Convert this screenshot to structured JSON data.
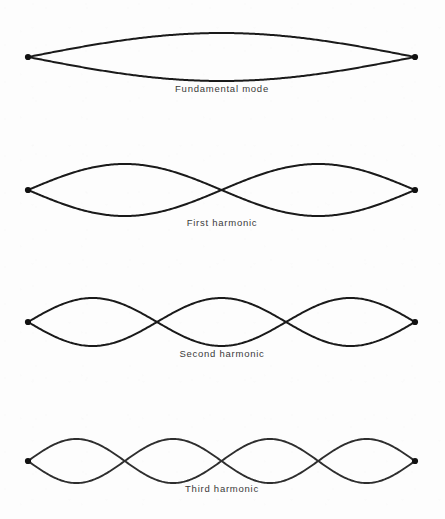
{
  "figure": {
    "background_color": "#fdfdfd",
    "line_color": "#1a1a1a",
    "label_color": "#3a3a3a",
    "string_left_x": 28,
    "string_right_x": 415
  },
  "modes": [
    {
      "label": "Fundamental mode",
      "loops": 1,
      "center_y": 57,
      "amplitude": 24,
      "label_y": 92,
      "label_x": 222,
      "style": "solid"
    },
    {
      "label": "First harmonic",
      "loops": 2,
      "center_y": 190,
      "amplitude": 26,
      "label_y": 226,
      "label_x": 222,
      "style": "solid"
    },
    {
      "label": "Second harmonic",
      "loops": 3,
      "center_y": 322,
      "amplitude": 24,
      "label_y": 357,
      "label_x": 222,
      "style": "solid"
    },
    {
      "label": "Third harmonic",
      "loops": 4,
      "center_y": 461,
      "amplitude": 22,
      "label_y": 492,
      "label_x": 222,
      "style": "faded"
    }
  ],
  "chart_data": {
    "type": "line",
    "xlabel": "",
    "ylabel": "",
    "x_range": [
      28,
      415
    ],
    "series": [
      {
        "name": "Fundamental mode",
        "harmonic_number": 1,
        "loops": 1,
        "nodes": 2,
        "antinodes": 1,
        "amplitude": 24,
        "baseline_y": 57
      },
      {
        "name": "First harmonic",
        "harmonic_number": 2,
        "loops": 2,
        "nodes": 3,
        "antinodes": 2,
        "amplitude": 26,
        "baseline_y": 190
      },
      {
        "name": "Second harmonic",
        "harmonic_number": 3,
        "loops": 3,
        "nodes": 4,
        "antinodes": 3,
        "amplitude": 24,
        "baseline_y": 322
      },
      {
        "name": "Third harmonic",
        "harmonic_number": 4,
        "loops": 4,
        "nodes": 5,
        "antinodes": 4,
        "amplitude": 22,
        "baseline_y": 461
      }
    ],
    "legend_position": "none",
    "grid": false
  }
}
